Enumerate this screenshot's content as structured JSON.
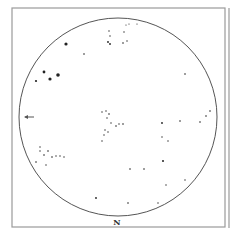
{
  "chart": {
    "type": "star-map",
    "frame": {
      "x": 12,
      "y": 8,
      "w": 213,
      "h": 219,
      "color": "#9a9a9a"
    },
    "side_line": {
      "x": 229,
      "y1": 8,
      "y2": 228,
      "color": "#9a9a9a"
    },
    "horizon": {
      "cx": 118,
      "cy": 117,
      "r": 99,
      "color": "#555555"
    },
    "compass_label": "N",
    "east_marker": {
      "x": 25,
      "y": 117
    },
    "stars": [
      {
        "x": 66,
        "y": 44,
        "r": 1.6
      },
      {
        "x": 44,
        "y": 72,
        "r": 1.4
      },
      {
        "x": 58,
        "y": 75,
        "r": 1.8
      },
      {
        "x": 50,
        "y": 79,
        "r": 1.6
      },
      {
        "x": 36,
        "y": 81,
        "r": 1.1
      },
      {
        "x": 84,
        "y": 54,
        "r": 0.8
      },
      {
        "x": 109,
        "y": 31,
        "r": 0.7
      },
      {
        "x": 110,
        "y": 36,
        "r": 0.7
      },
      {
        "x": 108,
        "y": 42,
        "r": 0.9
      },
      {
        "x": 110,
        "y": 44,
        "r": 0.9
      },
      {
        "x": 126,
        "y": 25,
        "r": 0.6
      },
      {
        "x": 129,
        "y": 24,
        "r": 0.6
      },
      {
        "x": 124,
        "y": 32,
        "r": 0.7
      },
      {
        "x": 123,
        "y": 43,
        "r": 0.8
      },
      {
        "x": 127,
        "y": 41,
        "r": 0.7
      },
      {
        "x": 137,
        "y": 24,
        "r": 0.6
      },
      {
        "x": 185,
        "y": 74,
        "r": 0.8
      },
      {
        "x": 210,
        "y": 111,
        "r": 0.8
      },
      {
        "x": 206,
        "y": 116,
        "r": 0.8
      },
      {
        "x": 200,
        "y": 122,
        "r": 0.8
      },
      {
        "x": 102,
        "y": 112,
        "r": 0.7
      },
      {
        "x": 106,
        "y": 111,
        "r": 0.7
      },
      {
        "x": 109,
        "y": 114,
        "r": 0.8
      },
      {
        "x": 107,
        "y": 118,
        "r": 0.7
      },
      {
        "x": 111,
        "y": 123,
        "r": 0.7
      },
      {
        "x": 116,
        "y": 126,
        "r": 0.8
      },
      {
        "x": 119,
        "y": 124,
        "r": 0.7
      },
      {
        "x": 123,
        "y": 124,
        "r": 0.8
      },
      {
        "x": 105,
        "y": 130,
        "r": 0.7
      },
      {
        "x": 108,
        "y": 132,
        "r": 0.7
      },
      {
        "x": 104,
        "y": 135,
        "r": 0.7
      },
      {
        "x": 102,
        "y": 141,
        "r": 0.7
      },
      {
        "x": 162,
        "y": 123,
        "r": 0.9
      },
      {
        "x": 180,
        "y": 121,
        "r": 0.8
      },
      {
        "x": 162,
        "y": 137,
        "r": 0.7
      },
      {
        "x": 168,
        "y": 141,
        "r": 0.7
      },
      {
        "x": 40,
        "y": 147,
        "r": 0.7
      },
      {
        "x": 40,
        "y": 151,
        "r": 0.7
      },
      {
        "x": 44,
        "y": 155,
        "r": 0.8
      },
      {
        "x": 48,
        "y": 151,
        "r": 0.8
      },
      {
        "x": 52,
        "y": 157,
        "r": 0.8
      },
      {
        "x": 56,
        "y": 156,
        "r": 0.7
      },
      {
        "x": 60,
        "y": 156,
        "r": 0.7
      },
      {
        "x": 64,
        "y": 157,
        "r": 0.7
      },
      {
        "x": 36,
        "y": 162,
        "r": 0.8
      },
      {
        "x": 46,
        "y": 165,
        "r": 0.7
      },
      {
        "x": 163,
        "y": 161,
        "r": 1.0
      },
      {
        "x": 130,
        "y": 169,
        "r": 0.8
      },
      {
        "x": 144,
        "y": 169,
        "r": 0.8
      },
      {
        "x": 166,
        "y": 185,
        "r": 0.7
      },
      {
        "x": 185,
        "y": 180,
        "r": 0.7
      },
      {
        "x": 128,
        "y": 203,
        "r": 0.8
      },
      {
        "x": 158,
        "y": 203,
        "r": 0.7
      },
      {
        "x": 96,
        "y": 198,
        "r": 0.9
      }
    ]
  }
}
